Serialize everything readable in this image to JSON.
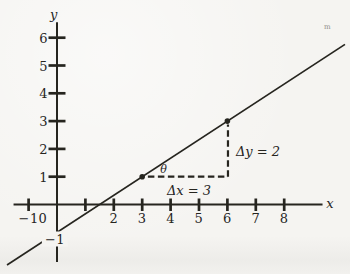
{
  "figure": {
    "kind": "textbook-line-plot",
    "paper_color": "#f5f4f1",
    "ink_color": "#26251f"
  },
  "chart_data": {
    "type": "line",
    "title": "",
    "equation": "y = (2/3)x - 1",
    "slope": 0.6667,
    "y_intercept": -1,
    "x_intercept": 1.5,
    "line_x_range": [
      -1.76,
      10.14
    ],
    "marked_points": [
      {
        "x": 3,
        "y": 1
      },
      {
        "x": 6,
        "y": 3
      }
    ],
    "axes": {
      "x_label": "x",
      "y_label": "y",
      "xlim": [
        -1.53,
        9.35
      ],
      "ylim": [
        -2.07,
        6.56
      ],
      "grid": false,
      "x_ticks": [
        -1,
        1,
        2,
        3,
        4,
        5,
        6,
        7,
        8
      ],
      "y_ticks": [
        1,
        2,
        3,
        4,
        5,
        6
      ],
      "x_tick_labels": [
        {
          "text": "−1",
          "x": -1,
          "y": -0.47
        },
        {
          "text": "0",
          "x": -0.5,
          "y": -0.47
        },
        {
          "text": "2",
          "x": 2,
          "y": -0.47
        },
        {
          "text": "3",
          "x": 3,
          "y": -0.47
        },
        {
          "text": "4",
          "x": 4,
          "y": -0.47
        },
        {
          "text": "5",
          "x": 5,
          "y": -0.47
        },
        {
          "text": "6",
          "x": 6,
          "y": -0.47
        },
        {
          "text": "7",
          "x": 7,
          "y": -0.47
        },
        {
          "text": "8",
          "x": 8,
          "y": -0.47
        }
      ],
      "y_tick_labels": [
        {
          "text": "6",
          "x": -0.47,
          "y": 6
        },
        {
          "text": "5",
          "x": -0.47,
          "y": 5
        },
        {
          "text": "4",
          "x": -0.47,
          "y": 4
        },
        {
          "text": "3",
          "x": -0.47,
          "y": 3
        },
        {
          "text": "2",
          "x": -0.47,
          "y": 2
        },
        {
          "text": "1",
          "x": -0.47,
          "y": 1
        },
        {
          "text": "−1",
          "x": -0.07,
          "y": -1.24,
          "boxed": true
        }
      ],
      "axis_letter_x": {
        "text": "x",
        "x": 9.61,
        "y": 0.04
      },
      "axis_letter_y": {
        "text": "y",
        "x": -0.12,
        "y": 6.87
      }
    },
    "slope_triangle": {
      "horizontal_leg": {
        "from": [
          3.2,
          1
        ],
        "to": [
          6.02,
          1
        ]
      },
      "vertical_leg": {
        "from": [
          6.02,
          1
        ],
        "to": [
          6.02,
          2.88
        ]
      },
      "dash_pattern": [
        6.5,
        3.5
      ]
    },
    "annotations": [
      {
        "name": "angle-theta-label",
        "text": "θ",
        "x": 3.75,
        "y": 1.28,
        "style": "theta it"
      },
      {
        "name": "delta-x-label",
        "text": "Δx = 3",
        "x": 4.65,
        "y": 0.52,
        "style": "it"
      },
      {
        "name": "delta-y-label",
        "text": "Δy = 2",
        "x": 7.08,
        "y": 1.91,
        "style": "it"
      },
      {
        "name": "stray-print-mark",
        "text": "m",
        "x": 9.52,
        "y": 6.38,
        "style": "faint"
      }
    ]
  }
}
